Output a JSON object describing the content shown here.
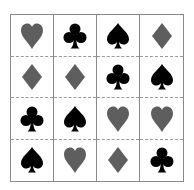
{
  "game": {
    "rows": 4,
    "cols": 4,
    "colors": {
      "red_suit": "#5e5e5e",
      "black_suit": "#000000",
      "grid_line": "#8a8a8a"
    },
    "cells": [
      [
        {
          "suit": "heart",
          "color": "gray"
        },
        {
          "suit": "club",
          "color": "black"
        },
        {
          "suit": "spade",
          "color": "black"
        },
        {
          "suit": "diamond",
          "color": "gray"
        }
      ],
      [
        {
          "suit": "diamond",
          "color": "gray"
        },
        {
          "suit": "diamond",
          "color": "gray"
        },
        {
          "suit": "club",
          "color": "black"
        },
        {
          "suit": "spade",
          "color": "black"
        }
      ],
      [
        {
          "suit": "club",
          "color": "black"
        },
        {
          "suit": "spade",
          "color": "black"
        },
        {
          "suit": "heart",
          "color": "gray"
        },
        {
          "suit": "heart",
          "color": "gray"
        }
      ],
      [
        {
          "suit": "spade",
          "color": "black"
        },
        {
          "suit": "heart",
          "color": "gray"
        },
        {
          "suit": "diamond",
          "color": "gray"
        },
        {
          "suit": "club",
          "color": "black"
        }
      ]
    ]
  }
}
